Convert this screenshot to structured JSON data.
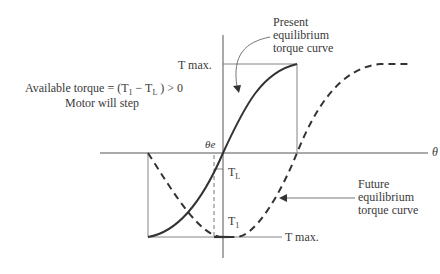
{
  "diagram": {
    "axis": {
      "x_label": "θ",
      "origin_label": "θe"
    },
    "labels": {
      "t_max_top": "T max.",
      "t_max_bottom": "T max.",
      "t_l": "T",
      "t_l_sub": "L",
      "t_1": "T",
      "t_1_sub": "1",
      "available_torque_line1": "Available torque = (T",
      "available_torque_sub1": "1",
      "available_torque_mid": " − T",
      "available_torque_sub2": "L",
      "available_torque_end": " ) > 0",
      "available_torque_line2": "Motor will step",
      "present_curve": [
        "Present",
        "equilibrium",
        "torque curve"
      ],
      "future_curve": [
        "Future",
        "equilibrium",
        "torque curve"
      ]
    },
    "curves": [
      {
        "name": "Present equilibrium torque curve",
        "style": "solid",
        "color": "#333333"
      },
      {
        "name": "Future equilibrium torque curve",
        "style": "dashed",
        "color": "#333333"
      }
    ],
    "colors": {
      "line": "#333333",
      "thin_line": "#777777",
      "background": "#ffffff"
    }
  }
}
